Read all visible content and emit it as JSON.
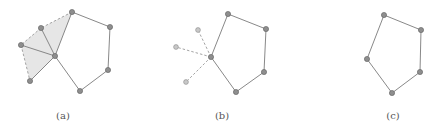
{
  "colors": {
    "edge": "#7a7a7a",
    "dashed_edge": "#9a9a9a",
    "node_fill": "#8e8e8e",
    "node_stroke": "#5e5e5e",
    "ghost_node_fill": "#c8c8c8",
    "ghost_node_stroke": "#8a8a8a",
    "shade": "#e6e6e6",
    "label": "#555555"
  },
  "panels": [
    {
      "id": "a",
      "caption": "(a)",
      "caption_pos": [
        63,
        119
      ],
      "nodes": {
        "C": [
          55,
          56
        ],
        "T": [
          72,
          12
        ],
        "R1": [
          110,
          27
        ],
        "R2": [
          108,
          70
        ],
        "B": [
          80,
          91
        ],
        "N1": [
          41,
          28
        ],
        "L": [
          21,
          45
        ],
        "BL": [
          30,
          81
        ]
      },
      "shaded_triangles": [
        [
          "C",
          "T",
          "N1"
        ],
        [
          "C",
          "N1",
          "L"
        ],
        [
          "C",
          "L",
          "BL"
        ]
      ],
      "solid_edges": [
        [
          "C",
          "T"
        ],
        [
          "T",
          "R1"
        ],
        [
          "R1",
          "R2"
        ],
        [
          "R2",
          "B"
        ],
        [
          "B",
          "C"
        ],
        [
          "C",
          "N1"
        ],
        [
          "C",
          "L"
        ],
        [
          "C",
          "BL"
        ]
      ],
      "dashed_edges": [
        [
          "T",
          "N1"
        ],
        [
          "N1",
          "L"
        ],
        [
          "L",
          "BL"
        ]
      ],
      "ghost_nodes": []
    },
    {
      "id": "b",
      "caption": "(b)",
      "caption_pos": [
        222,
        119
      ],
      "nodes": {
        "C": [
          211,
          57
        ],
        "T": [
          228,
          14
        ],
        "R1": [
          266,
          29
        ],
        "R2": [
          264,
          72
        ],
        "B": [
          236,
          92
        ]
      },
      "shaded_triangles": [],
      "solid_edges": [
        [
          "C",
          "T"
        ],
        [
          "T",
          "R1"
        ],
        [
          "R1",
          "R2"
        ],
        [
          "R2",
          "B"
        ],
        [
          "B",
          "C"
        ]
      ],
      "dashed_edges": [
        [
          "C",
          "G1"
        ],
        [
          "C",
          "G2"
        ],
        [
          "C",
          "G3"
        ]
      ],
      "ghost_nodes": {
        "G1": [
          198,
          30
        ],
        "G2": [
          176,
          47
        ],
        "G3": [
          186,
          82
        ]
      }
    },
    {
      "id": "c",
      "caption": "(c)",
      "caption_pos": [
        393,
        119
      ],
      "nodes": {
        "L": [
          367,
          59
        ],
        "T": [
          384,
          15
        ],
        "R1": [
          421,
          30
        ],
        "R2": [
          420,
          72
        ],
        "B": [
          392,
          93
        ]
      },
      "shaded_triangles": [],
      "solid_edges": [
        [
          "L",
          "T"
        ],
        [
          "T",
          "R1"
        ],
        [
          "R1",
          "R2"
        ],
        [
          "R2",
          "B"
        ],
        [
          "B",
          "L"
        ]
      ],
      "dashed_edges": [],
      "ghost_nodes": []
    }
  ]
}
